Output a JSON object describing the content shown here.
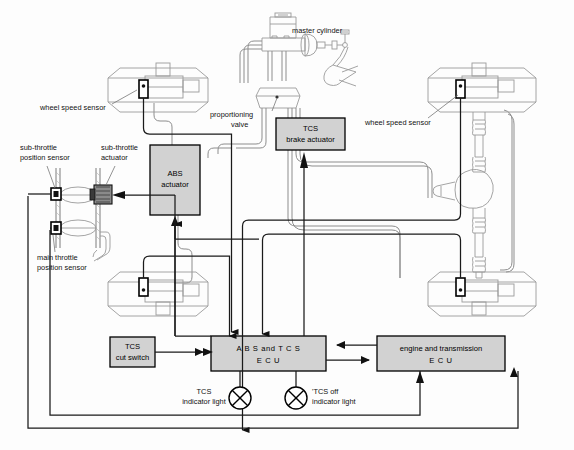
{
  "diagram": {
    "width": 574,
    "height": 450,
    "background_color": "#fdfdfd",
    "wire_color": "#1a1a1a",
    "hydraulic_color": "#8d8d8d",
    "box_fill_color": "#d2d2d2"
  },
  "labels": {
    "master_cylinder": "master cylinder",
    "proportioning_valve_line1": "proportioning",
    "proportioning_valve_line2": "valve",
    "wheel_speed_sensor_left": "wheel speed sensor",
    "wheel_speed_sensor_right": "wheel speed sensor",
    "sub_throttle_position_sensor_line1": "sub-throttle",
    "sub_throttle_position_sensor_line2": "position sensor",
    "sub_throttle_actuator_line1": "sub-throttle",
    "sub_throttle_actuator_line2": "actuator",
    "main_throttle_position_sensor_line1": "main throttle",
    "main_throttle_position_sensor_line2": "position sensor",
    "tcs_indicator_light_line1": "TCS",
    "tcs_indicator_light_line2": "indicator light",
    "tcs_off_indicator_light_line1": "'TCS off",
    "tcs_off_indicator_light_line2": "indicator light"
  },
  "boxes": {
    "abs_actuator": {
      "line1": "ABS",
      "line2": "actuator",
      "x": 150,
      "y": 145,
      "w": 50,
      "h": 70
    },
    "tcs_brake_actuator": {
      "line1": "TCS",
      "line2": "brake actuator",
      "x": 276,
      "y": 118,
      "w": 69,
      "h": 32
    },
    "abs_and_tcs_ecu": {
      "line1": "A B S  and T C S",
      "line2": "E C U",
      "x": 211,
      "y": 336,
      "w": 115,
      "h": 35
    },
    "engine_and_transmission_ecu": {
      "line1": "engine and transmission",
      "line2": "E C U",
      "x": 377,
      "y": 336,
      "w": 128,
      "h": 35
    },
    "tcs_cut_switch": {
      "line1": "TCS",
      "line2": "cut switch",
      "x": 110,
      "y": 337,
      "w": 45,
      "h": 30
    }
  },
  "components": {
    "wheels": [
      {
        "name": "front-left-wheel-brake",
        "x": 108,
        "y": 68,
        "w": 100,
        "h": 44
      },
      {
        "name": "front-right-wheel-brake",
        "x": 428,
        "y": 68,
        "w": 108,
        "h": 44
      },
      {
        "name": "rear-left-wheel-brake",
        "x": 108,
        "y": 272,
        "w": 100,
        "h": 44
      },
      {
        "name": "rear-right-wheel-brake",
        "x": 428,
        "y": 272,
        "w": 108,
        "h": 44
      }
    ],
    "indicator_lights": [
      {
        "name": "tcs-indicator-light",
        "cx": 240,
        "cy": 398,
        "r": 11
      },
      {
        "name": "tcs-off-indicator-light",
        "cx": 296,
        "cy": 398,
        "r": 11
      }
    ]
  }
}
